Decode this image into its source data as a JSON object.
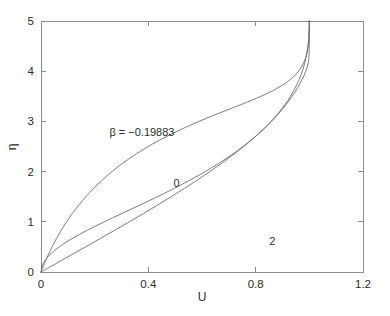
{
  "figure": {
    "background_color": "#ffffff",
    "axis_color": "#8c8c8c",
    "curve_color": "#6e6e6e",
    "text_color": "#2b2b2b"
  },
  "chart_data": {
    "type": "line",
    "title": "",
    "subtitle": "",
    "xlabel": "U",
    "ylabel": "η",
    "xlim": [
      0,
      1.2
    ],
    "ylim": [
      0,
      5
    ],
    "xticks": [
      0,
      0.4,
      0.8,
      1.2
    ],
    "xticklabels": [
      "0",
      "0.4",
      "0.8",
      "1.2"
    ],
    "yticks": [
      0,
      1,
      2,
      3,
      4,
      5
    ],
    "yticklabels": [
      "0",
      "1",
      "2",
      "3",
      "4",
      "5"
    ],
    "grid": false,
    "legend": "none",
    "box": true,
    "annotations": [
      {
        "text": "β = −0.19883",
        "x": 0.255,
        "y": 2.79,
        "anchor": "start"
      },
      {
        "text": "0",
        "x": 0.505,
        "y": 1.78,
        "anchor": "middle"
      },
      {
        "text": "2",
        "x": 0.862,
        "y": 0.61,
        "anchor": "middle"
      }
    ],
    "series": [
      {
        "name": "β = −0.19883",
        "label": "β = −0.19883",
        "x": [
          0,
          0.008,
          0.031,
          0.068,
          0.116,
          0.173,
          0.236,
          0.302,
          0.369,
          0.434,
          0.497,
          0.556,
          0.612,
          0.663,
          0.71,
          0.753,
          0.792,
          0.827,
          0.858,
          0.885,
          0.909,
          0.93,
          0.947,
          0.962,
          0.974,
          0.983,
          0.99,
          0.995,
          0.998,
          0.9995,
          1.0
        ],
        "y": [
          0,
          0.167,
          0.333,
          0.5,
          0.667,
          0.833,
          1.0,
          1.167,
          1.333,
          1.5,
          1.667,
          1.833,
          2.0,
          2.167,
          2.333,
          2.5,
          2.667,
          2.833,
          3.0,
          3.167,
          3.333,
          3.5,
          3.667,
          3.833,
          4.0,
          4.167,
          4.333,
          4.5,
          4.667,
          4.833,
          5.0
        ]
      },
      {
        "name": "β = 0",
        "label": "0",
        "x": [
          0,
          0.0553,
          0.1106,
          0.1658,
          0.2208,
          0.2753,
          0.3292,
          0.3823,
          0.4344,
          0.4854,
          0.535,
          0.583,
          0.6292,
          0.6735,
          0.7155,
          0.7552,
          0.7923,
          0.8268,
          0.8585,
          0.8873,
          0.9131,
          0.936,
          0.9559,
          0.9728,
          0.9868,
          0.9962,
          0.999,
          0.99985,
          0.99999,
          1.0,
          1.0
        ],
        "y": [
          0,
          0.167,
          0.333,
          0.5,
          0.667,
          0.833,
          1.0,
          1.167,
          1.333,
          1.5,
          1.667,
          1.833,
          2.0,
          2.167,
          2.333,
          2.5,
          2.667,
          2.833,
          3.0,
          3.167,
          3.333,
          3.5,
          3.667,
          3.833,
          4.0,
          4.167,
          4.333,
          4.5,
          4.667,
          4.833,
          5.0
        ]
      },
      {
        "name": "β = 2",
        "label": "2",
        "x": [
          0,
          0.0125,
          0.0262,
          0.0412,
          0.0576,
          0.0756,
          0.0953,
          0.117,
          0.1409,
          0.1672,
          0.1963,
          0.2286,
          0.2645,
          0.3046,
          0.3494,
          0.3996,
          0.4558,
          0.5188,
          0.5888,
          0.665,
          0.7444,
          0.82,
          0.883,
          0.929,
          0.9597,
          0.9788,
          0.9897,
          0.9954,
          0.9982,
          0.9994,
          1.0
        ],
        "y": [
          0,
          0.167,
          0.333,
          0.5,
          0.667,
          0.833,
          1.0,
          1.167,
          1.333,
          1.5,
          1.667,
          1.833,
          2.0,
          2.167,
          2.333,
          2.5,
          2.667,
          2.833,
          3.0,
          3.167,
          3.333,
          3.5,
          3.667,
          3.833,
          4.0,
          4.167,
          4.333,
          4.5,
          4.667,
          4.833,
          5.0
        ]
      }
    ]
  }
}
